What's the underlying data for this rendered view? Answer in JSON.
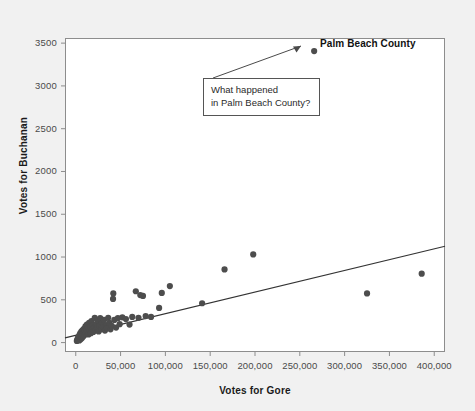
{
  "chart_data": {
    "type": "scatter",
    "title": "",
    "xlabel": "Votes for Gore",
    "ylabel": "Votes for Buchanan",
    "xlim": [
      -12000,
      412000
    ],
    "ylim": [
      -110,
      3560
    ],
    "grid": false,
    "legend": "none",
    "xticks": [
      0,
      50000,
      100000,
      150000,
      200000,
      250000,
      300000,
      350000,
      400000
    ],
    "xticklabels": [
      "0",
      "50,000",
      "100,000",
      "150,000",
      "200,000",
      "250,000",
      "300,000",
      "350,000",
      "400,000"
    ],
    "yticks": [
      0,
      500,
      1000,
      1500,
      2000,
      2500,
      3000,
      3500
    ],
    "yticklabels": [
      "0",
      "500",
      "1000",
      "1500",
      "2000",
      "2500",
      "3000",
      "3500"
    ],
    "marker_color": "#4d4d4d",
    "line_color": "#333333",
    "points": [
      [
        1200,
        20
      ],
      [
        1800,
        30
      ],
      [
        2100,
        45
      ],
      [
        2600,
        55
      ],
      [
        3000,
        35
      ],
      [
        3400,
        70
      ],
      [
        3900,
        25
      ],
      [
        4200,
        90
      ],
      [
        4600,
        60
      ],
      [
        5100,
        110
      ],
      [
        5500,
        40
      ],
      [
        6000,
        80
      ],
      [
        6400,
        130
      ],
      [
        6900,
        55
      ],
      [
        7300,
        100
      ],
      [
        7800,
        145
      ],
      [
        8200,
        70
      ],
      [
        8700,
        120
      ],
      [
        9100,
        160
      ],
      [
        9600,
        85
      ],
      [
        10200,
        135
      ],
      [
        10800,
        190
      ],
      [
        11300,
        105
      ],
      [
        11900,
        150
      ],
      [
        12400,
        210
      ],
      [
        13000,
        120
      ],
      [
        13600,
        175
      ],
      [
        14200,
        95
      ],
      [
        14900,
        230
      ],
      [
        15500,
        140
      ],
      [
        16200,
        185
      ],
      [
        16900,
        110
      ],
      [
        17500,
        250
      ],
      [
        18200,
        160
      ],
      [
        18900,
        205
      ],
      [
        19600,
        125
      ],
      [
        20400,
        175
      ],
      [
        21200,
        290
      ],
      [
        22000,
        145
      ],
      [
        22900,
        215
      ],
      [
        23700,
        170
      ],
      [
        24600,
        260
      ],
      [
        25500,
        130
      ],
      [
        26400,
        195
      ],
      [
        27300,
        285
      ],
      [
        28300,
        155
      ],
      [
        29300,
        225
      ],
      [
        30400,
        180
      ],
      [
        31500,
        265
      ],
      [
        32600,
        140
      ],
      [
        33800,
        205
      ],
      [
        35000,
        170
      ],
      [
        36200,
        290
      ],
      [
        37500,
        230
      ],
      [
        38800,
        155
      ],
      [
        40200,
        195
      ],
      [
        41600,
        510
      ],
      [
        41900,
        575
      ],
      [
        43000,
        265
      ],
      [
        45000,
        175
      ],
      [
        47000,
        285
      ],
      [
        49000,
        215
      ],
      [
        52000,
        295
      ],
      [
        56000,
        275
      ],
      [
        60000,
        210
      ],
      [
        63000,
        300
      ],
      [
        67000,
        600
      ],
      [
        70000,
        290
      ],
      [
        72000,
        555
      ],
      [
        75000,
        545
      ],
      [
        78000,
        310
      ],
      [
        84000,
        300
      ],
      [
        93000,
        405
      ],
      [
        96000,
        580
      ],
      [
        105000,
        660
      ],
      [
        141000,
        460
      ],
      [
        166000,
        855
      ],
      [
        198000,
        1030
      ],
      [
        266000,
        3407
      ],
      [
        325000,
        575
      ],
      [
        386000,
        805
      ]
    ],
    "fit_line": {
      "x0": -12000,
      "y0": 55,
      "x1": 412000,
      "y1": 1125
    },
    "outlier": {
      "name": "Palm Beach County",
      "x": 266000,
      "y": 3407
    },
    "annotation": {
      "line1": "What happened",
      "line2": "in Palm Beach County?"
    }
  }
}
